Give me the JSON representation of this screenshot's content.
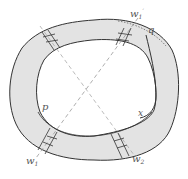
{
  "diagram": {
    "type": "annulus-with-cross-cuts",
    "colors": {
      "band_fill": "#e3e3e3",
      "stroke": "#333333",
      "dashed_line": "#999999",
      "label": "#555555"
    },
    "labels": {
      "w1": "w",
      "w1_sub": "1",
      "w1prime": "w",
      "w1prime_sub": "1",
      "w1prime_mark": "′",
      "w2": "w",
      "w2_sub": "2",
      "p": "p",
      "q": "q",
      "x": "x"
    }
  }
}
